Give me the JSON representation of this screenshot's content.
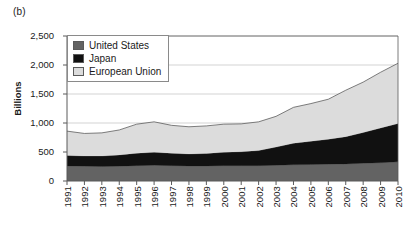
{
  "panel": {
    "label": "(b)"
  },
  "axes": {
    "ylabel": "Billions",
    "yticks": [
      "0",
      "500",
      "1,000",
      "1,500",
      "2,000",
      "2,500"
    ],
    "xticks": [
      "1991",
      "1992",
      "1993",
      "1994",
      "1995",
      "1996",
      "1997",
      "1998",
      "1999",
      "2000",
      "2001",
      "2002",
      "2003",
      "2004",
      "2005",
      "2006",
      "2007",
      "2008",
      "2009",
      "2010"
    ]
  },
  "legend": {
    "items": [
      {
        "label": "United States",
        "color": "#636363"
      },
      {
        "label": "Japan",
        "color": "#111111"
      },
      {
        "label": "European Union",
        "color": "#dcdcdc"
      }
    ]
  },
  "colors": {
    "united_states": "#636363",
    "japan": "#111111",
    "european_union": "#dcdcdc",
    "axis": "#5a5a5a",
    "grid": "#c8c8c8",
    "text": "#1a1a1a"
  },
  "chart_data": {
    "type": "area",
    "stacked": true,
    "title": "(b)",
    "xlabel": "",
    "ylabel": "Billions",
    "ylim": [
      0,
      2500
    ],
    "ytick_values": [
      0,
      500,
      1000,
      1500,
      2000,
      2500
    ],
    "grid": true,
    "legend_position": "top-left",
    "categories": [
      "1991",
      "1992",
      "1993",
      "1994",
      "1995",
      "1996",
      "1997",
      "1998",
      "1999",
      "2000",
      "2001",
      "2002",
      "2003",
      "2004",
      "2005",
      "2006",
      "2007",
      "2008",
      "2009",
      "2010"
    ],
    "series": [
      {
        "name": "United States",
        "color": "#636363",
        "values": [
          260,
          255,
          250,
          255,
          265,
          270,
          265,
          260,
          260,
          265,
          265,
          265,
          270,
          280,
          285,
          290,
          295,
          305,
          315,
          330
        ]
      },
      {
        "name": "Japan",
        "color": "#111111",
        "values": [
          180,
          175,
          180,
          195,
          215,
          225,
          215,
          205,
          215,
          230,
          240,
          260,
          315,
          370,
          400,
          430,
          470,
          530,
          600,
          660
        ]
      },
      {
        "name": "European Union",
        "color": "#dcdcdc",
        "values": [
          420,
          390,
          400,
          430,
          500,
          525,
          480,
          470,
          475,
          485,
          480,
          495,
          530,
          620,
          650,
          690,
          800,
          870,
          960,
          1040
        ]
      }
    ],
    "totals": [
      860,
      820,
      830,
      880,
      980,
      1020,
      960,
      935,
      950,
      980,
      985,
      1020,
      1115,
      1270,
      1335,
      1410,
      1565,
      1705,
      1875,
      2030
    ]
  }
}
